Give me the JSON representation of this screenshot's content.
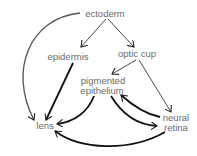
{
  "diagram": {
    "nodes": {
      "ectoderm": "ectoderm",
      "epidermis": "epidermis",
      "optic_cup": "optic cup",
      "pigmented_1": "pigmented",
      "pigmented_2": "epithelium",
      "lens": "lens",
      "neural_1": "neural",
      "neural_2": "retina"
    },
    "edges": [
      {
        "from": "ectoderm",
        "to": "epidermis"
      },
      {
        "from": "ectoderm",
        "to": "optic cup"
      },
      {
        "from": "ectoderm",
        "to": "lens"
      },
      {
        "from": "optic cup",
        "to": "pigmented epithelium"
      },
      {
        "from": "optic cup",
        "to": "neural retina"
      },
      {
        "from": "epidermis",
        "to": "lens"
      },
      {
        "from": "pigmented epithelium",
        "to": "lens"
      },
      {
        "from": "pigmented epithelium",
        "to": "neural retina"
      },
      {
        "from": "neural retina",
        "to": "pigmented epithelium"
      },
      {
        "from": "neural retina",
        "to": "lens"
      }
    ],
    "colors": {
      "text": "#6a6a6a",
      "arrow": "#111111",
      "arrow_gray": "#555555"
    }
  }
}
